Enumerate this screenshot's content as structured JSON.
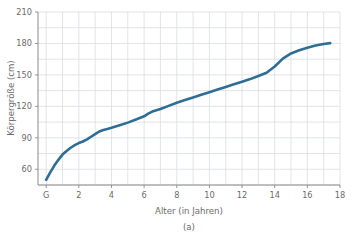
{
  "chart_data": {
    "type": "line",
    "title": "",
    "subtitle": "",
    "caption": "(a)",
    "xlabel": "Alter (in Jahren)",
    "ylabel": "Körpergröße (cm)",
    "xlim": [
      -0.5,
      18
    ],
    "ylim": [
      45,
      210
    ],
    "grid": true,
    "grid_x_step": 1,
    "grid_y_step": 15,
    "legend": null,
    "legend_position": "none",
    "x_tick_labels": [
      "G",
      "2",
      "4",
      "6",
      "8",
      "10",
      "12",
      "14",
      "16",
      "18"
    ],
    "x_tick_values": [
      0,
      2,
      4,
      6,
      8,
      10,
      12,
      14,
      16,
      18
    ],
    "y_tick_labels": [
      "60",
      "90",
      "120",
      "150",
      "180",
      "210"
    ],
    "y_tick_values": [
      60,
      90,
      120,
      150,
      180,
      210
    ],
    "line_color": "#2e6e95",
    "line_width": 2.6,
    "series": [
      {
        "name": "Körpergröße",
        "x": [
          0,
          0.25,
          0.5,
          0.75,
          1,
          1.25,
          1.5,
          1.75,
          2,
          2.25,
          2.5,
          2.75,
          3,
          3.25,
          3.5,
          3.75,
          4,
          4.5,
          5,
          5.5,
          6,
          6.25,
          6.5,
          7,
          7.5,
          8,
          8.5,
          9,
          9.5,
          10,
          10.5,
          11,
          11.5,
          12,
          12.5,
          13,
          13.5,
          14,
          14.5,
          15,
          15.5,
          16,
          16.5,
          17,
          17.4
        ],
        "y": [
          50,
          57,
          63.5,
          69,
          74,
          77.5,
          80.5,
          83,
          85,
          86.5,
          88.5,
          91,
          93.5,
          96,
          97.5,
          98.5,
          99.5,
          102,
          104.5,
          107.5,
          110.5,
          113,
          115,
          117.5,
          120.5,
          123.5,
          126,
          128.5,
          131,
          133.5,
          136,
          138.5,
          141,
          143.5,
          146,
          149,
          152,
          158,
          165.5,
          170.5,
          173.5,
          176,
          178,
          179.5,
          180.3
        ]
      }
    ]
  },
  "axes": {
    "x_axis_name": "Alter (in Jahren)",
    "y_axis_name": "Körpergröße (cm)"
  },
  "figure": {
    "caption": "(a)"
  },
  "colors": {
    "line": "#2e6e95",
    "grid": "#d9dde2",
    "spine": "#8a8a8a",
    "text": "#6b6b6b",
    "background": "#ffffff"
  }
}
